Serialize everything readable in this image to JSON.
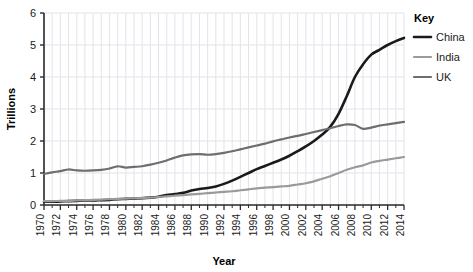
{
  "chart_data": {
    "type": "line",
    "title": "",
    "xlabel": "Year",
    "ylabel": "Trillions",
    "xlim": [
      1970,
      2014
    ],
    "ylim": [
      0,
      6
    ],
    "y_ticks": [
      "0",
      "1",
      "2",
      "3",
      "4",
      "5",
      "6"
    ],
    "grid": true,
    "legend_position": "right",
    "legend_title": "Key",
    "x": [
      1970,
      1971,
      1972,
      1973,
      1974,
      1975,
      1976,
      1977,
      1978,
      1979,
      1980,
      1981,
      1982,
      1983,
      1984,
      1985,
      1986,
      1987,
      1988,
      1989,
      1990,
      1991,
      1992,
      1993,
      1994,
      1995,
      1996,
      1997,
      1998,
      1999,
      2000,
      2001,
      2002,
      2003,
      2004,
      2005,
      2006,
      2007,
      2008,
      2009,
      2010,
      2011,
      2012,
      2013,
      2014
    ],
    "x_tick_labels": [
      "1970",
      "1972",
      "1974",
      "1976",
      "1978",
      "1980",
      "1982",
      "1984",
      "1986",
      "1988",
      "1990",
      "1992",
      "1994",
      "1996",
      "1998",
      "2000",
      "2002",
      "2004",
      "2006",
      "2008",
      "2010",
      "2012",
      "2014"
    ],
    "series": [
      {
        "name": "China",
        "color": "#1a1a1a",
        "width": 2.6,
        "values": [
          0.1,
          0.1,
          0.11,
          0.12,
          0.13,
          0.14,
          0.14,
          0.15,
          0.16,
          0.18,
          0.19,
          0.2,
          0.21,
          0.23,
          0.26,
          0.31,
          0.34,
          0.38,
          0.45,
          0.5,
          0.53,
          0.58,
          0.66,
          0.76,
          0.88,
          1.0,
          1.12,
          1.22,
          1.32,
          1.42,
          1.54,
          1.68,
          1.83,
          2.0,
          2.2,
          2.45,
          2.85,
          3.4,
          4.0,
          4.4,
          4.7,
          4.85,
          5.0,
          5.12,
          5.22
        ]
      },
      {
        "name": "India",
        "color": "#9a9a9a",
        "width": 2.2,
        "values": [
          0.12,
          0.12,
          0.13,
          0.13,
          0.14,
          0.15,
          0.16,
          0.17,
          0.18,
          0.19,
          0.2,
          0.21,
          0.22,
          0.23,
          0.25,
          0.27,
          0.29,
          0.31,
          0.33,
          0.35,
          0.37,
          0.39,
          0.41,
          0.43,
          0.46,
          0.49,
          0.52,
          0.54,
          0.56,
          0.58,
          0.6,
          0.64,
          0.68,
          0.74,
          0.82,
          0.9,
          1.0,
          1.1,
          1.18,
          1.24,
          1.33,
          1.38,
          1.42,
          1.46,
          1.5
        ]
      },
      {
        "name": "UK",
        "color": "#6e6e6e",
        "width": 2.2,
        "values": [
          0.97,
          1.02,
          1.06,
          1.11,
          1.08,
          1.07,
          1.08,
          1.1,
          1.14,
          1.21,
          1.17,
          1.19,
          1.21,
          1.26,
          1.32,
          1.39,
          1.48,
          1.55,
          1.58,
          1.59,
          1.57,
          1.59,
          1.63,
          1.68,
          1.74,
          1.8,
          1.86,
          1.92,
          1.99,
          2.05,
          2.11,
          2.16,
          2.22,
          2.28,
          2.34,
          2.4,
          2.47,
          2.52,
          2.5,
          2.38,
          2.42,
          2.48,
          2.52,
          2.56,
          2.6
        ]
      }
    ]
  }
}
